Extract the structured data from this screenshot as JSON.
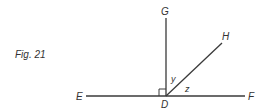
{
  "figure": {
    "caption": "Fig. 21",
    "points": {
      "E": "E",
      "F": "F",
      "D": "D",
      "G": "G",
      "H": "H"
    },
    "angles": {
      "y": "y",
      "z": "z"
    },
    "colors": {
      "line": "#3a3a3a",
      "text": "#333333"
    }
  }
}
